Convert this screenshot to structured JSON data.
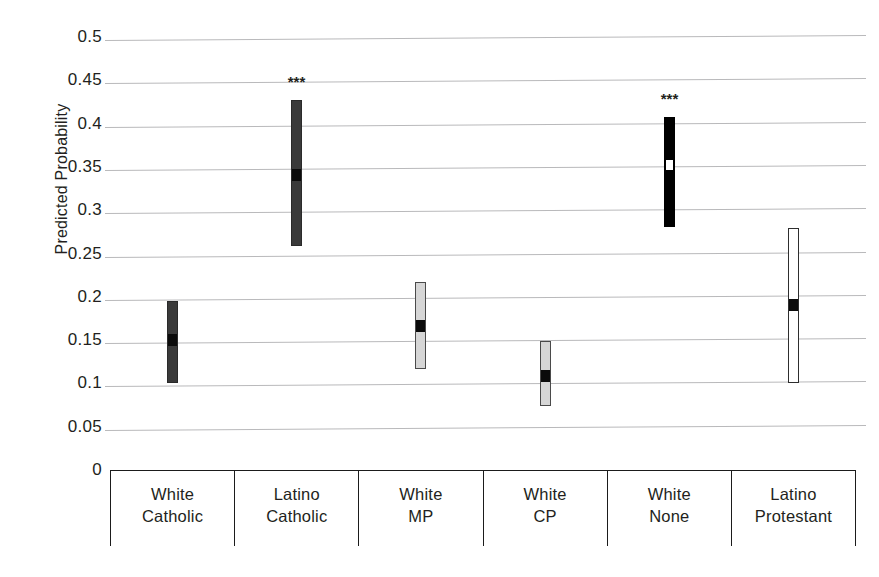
{
  "chart_data": {
    "type": "bar",
    "subtype": "confidence-interval-range-plot",
    "title": "",
    "xlabel": "",
    "ylabel": "Predicted Probability",
    "ylim": [
      0,
      0.5
    ],
    "ytick_values": [
      0.5,
      0.45,
      0.4,
      0.35,
      0.3,
      0.25,
      0.2,
      0.15,
      0.1,
      0.05,
      0
    ],
    "ytick_labels": [
      "0.5",
      "0.45",
      "0.4",
      "0.35",
      "0.3",
      "0.25",
      "0.2",
      "0.15",
      "0.1",
      "0.05",
      "0"
    ],
    "grid": true,
    "legend": "none",
    "categories": [
      "White Catholic",
      "Latino Catholic",
      "White MP",
      "White CP",
      "White None",
      "Latino Protestant"
    ],
    "category_lines": [
      [
        "White",
        "Catholic"
      ],
      [
        "Latino",
        "Catholic"
      ],
      [
        "White",
        "MP"
      ],
      [
        "White",
        "CP"
      ],
      [
        "White",
        "None"
      ],
      [
        "Latino",
        "Protestant"
      ]
    ],
    "series": [
      {
        "name": "Predicted Probability with 95% CI",
        "points": [
          {
            "category": "White Catholic",
            "estimate": 0.15,
            "ci_low": 0.1,
            "ci_high": 0.195,
            "style": "dark",
            "marker": "dark",
            "significance": ""
          },
          {
            "category": "Latino Catholic",
            "estimate": 0.341,
            "ci_low": 0.259,
            "ci_high": 0.427,
            "style": "dark",
            "marker": "dark",
            "significance": "***"
          },
          {
            "category": "White MP",
            "estimate": 0.166,
            "ci_low": 0.117,
            "ci_high": 0.217,
            "style": "light",
            "marker": "dark",
            "significance": ""
          },
          {
            "category": "White CP",
            "estimate": 0.109,
            "ci_low": 0.074,
            "ci_high": 0.149,
            "style": "light",
            "marker": "dark",
            "significance": ""
          },
          {
            "category": "White None",
            "estimate": 0.352,
            "ci_low": 0.281,
            "ci_high": 0.408,
            "style": "black",
            "marker": "white",
            "significance": "***"
          },
          {
            "category": "Latino Protestant",
            "estimate": 0.19,
            "ci_low": 0.1,
            "ci_high": 0.28,
            "style": "white",
            "marker": "dark",
            "significance": ""
          }
        ]
      }
    ],
    "colors": {
      "gridline": "#b9b9bb",
      "axis": "#1b1b1b",
      "text": "#231f20",
      "bar_dark": "#3a3a3a",
      "bar_black": "#000000",
      "bar_light": "#d6d6d6",
      "bar_white": "#ffffff"
    }
  }
}
